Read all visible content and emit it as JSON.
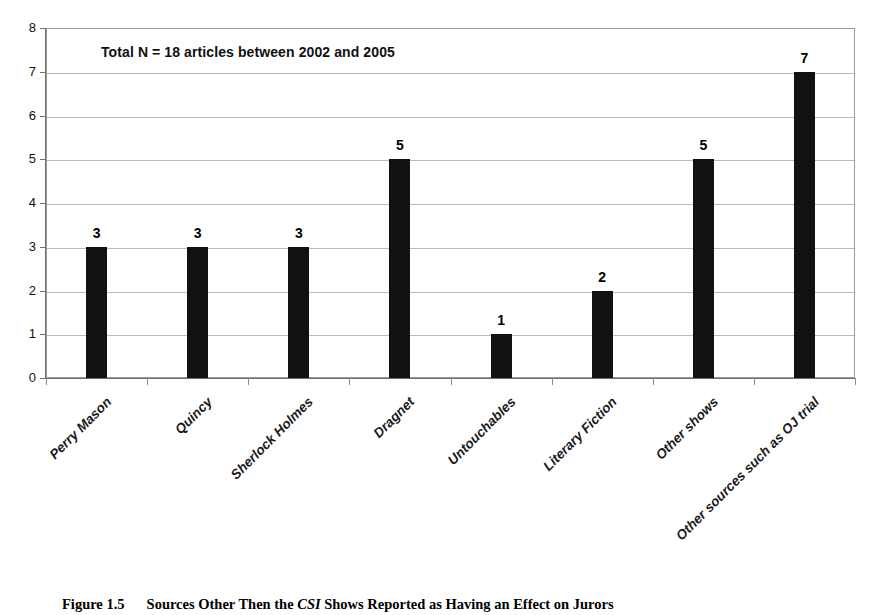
{
  "chart_data": {
    "type": "bar",
    "title": "",
    "annotation": "Total N = 18 articles between 2002 and 2005",
    "categories": [
      "Perry Mason",
      "Quincy",
      "Sherlock Holmes",
      "Dragnet",
      "Untouchables",
      "Literary Fiction",
      "Other shows",
      "Other sources such as OJ trial"
    ],
    "values": [
      3,
      3,
      3,
      5,
      1,
      2,
      5,
      7
    ],
    "xlabel": "",
    "ylabel": "",
    "ylim": [
      0,
      8
    ],
    "yticks": [
      0,
      1,
      2,
      3,
      4,
      5,
      6,
      7,
      8
    ],
    "ytick_labels": [
      "0",
      "1",
      "2",
      "3",
      "4",
      "5",
      "6",
      "7",
      "8"
    ],
    "grid": true,
    "legend": false,
    "bar_color": "#111111",
    "gridline_color": "#b9b9b9",
    "axis_color": "#6f6f6f"
  },
  "caption": {
    "figure_number": "Figure 1.5",
    "text_part_1": "Sources Other Then the ",
    "text_italic": "CSI",
    "text_part_2": " Shows Reported as Having an Effect on Jurors"
  }
}
